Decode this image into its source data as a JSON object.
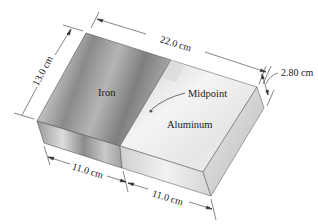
{
  "diagram": {
    "materials": {
      "left": "Iron",
      "right": "Aluminum"
    },
    "annotations": {
      "midpoint": "Midpoint"
    },
    "dimensions": {
      "total_length": "22.0 cm",
      "width": "13.0 cm",
      "thickness": "2.80 cm",
      "iron_length": "11.0 cm",
      "aluminum_length": "11.0 cm"
    },
    "colors": {
      "iron_top": "#9a9a9a",
      "aluminum_top": "#e4e4e4",
      "edge": "#4a4a4a",
      "dimension_line": "#333333"
    }
  }
}
